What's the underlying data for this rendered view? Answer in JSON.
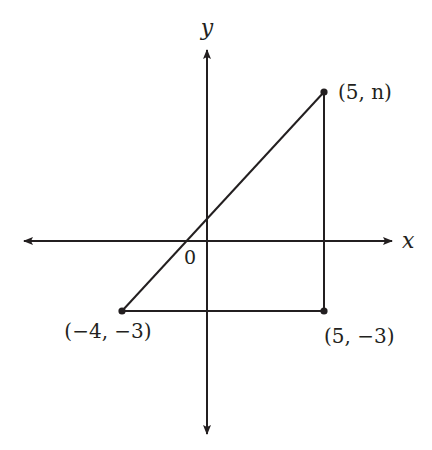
{
  "diagram": {
    "type": "coordinate-plane-triangle",
    "axes": {
      "x_label": "x",
      "y_label": "y",
      "origin_label": "0"
    },
    "points": [
      {
        "id": "top-right",
        "label": "(5, n)",
        "x": 5,
        "y": "n"
      },
      {
        "id": "bottom-right",
        "label": "(5, −3)",
        "x": 5,
        "y": -3
      },
      {
        "id": "bottom-left",
        "label": "(−4, −3)",
        "x": -4,
        "y": -3
      }
    ],
    "segments": [
      {
        "from": "bottom-left",
        "to": "top-right"
      },
      {
        "from": "top-right",
        "to": "bottom-right"
      },
      {
        "from": "bottom-right",
        "to": "bottom-left"
      }
    ],
    "colors": {
      "stroke": "#231f20",
      "background": "#ffffff"
    }
  }
}
